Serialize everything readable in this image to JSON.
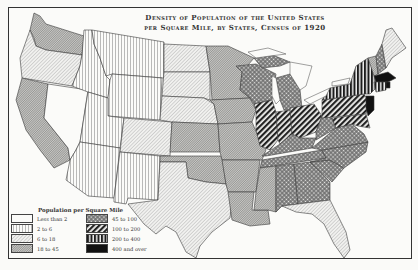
{
  "title": {
    "line1": "Density of Population of the United States",
    "line2": "per Square Mile, by States, Census of 1920"
  },
  "legend": {
    "title": "Population per Square Mile",
    "items": [
      {
        "label": "Less than 2",
        "pattern": "blank"
      },
      {
        "label": "2 to 6",
        "pattern": "vertical-lines"
      },
      {
        "label": "6 to 18",
        "pattern": "light-diagonal"
      },
      {
        "label": "18 to 45",
        "pattern": "dense-diagonal"
      },
      {
        "label": "45 to 100",
        "pattern": "crosshatch-dots"
      },
      {
        "label": "100 to 200",
        "pattern": "heavy-diagonal"
      },
      {
        "label": "200 to 400",
        "pattern": "heavy-vertical"
      },
      {
        "label": "400 and over",
        "pattern": "solid-black"
      }
    ]
  },
  "states": {
    "less_than_2": [
      "Nevada"
    ],
    "2_to_6": [
      "Montana",
      "Idaho",
      "Wyoming",
      "Utah",
      "Arizona",
      "New Mexico"
    ],
    "6_to_18": [
      "Oregon",
      "North Dakota",
      "South Dakota",
      "Nebraska",
      "Colorado",
      "Texas",
      "Florida",
      "Maine"
    ],
    "18_to_45": [
      "Washington",
      "California",
      "Minnesota",
      "Iowa",
      "Kansas",
      "Oklahoma",
      "Missouri",
      "Arkansas",
      "Louisiana",
      "Mississippi",
      "Vermont",
      "New Hampshire"
    ],
    "45_to_100": [
      "Wisconsin",
      "Michigan",
      "Kentucky",
      "Tennessee",
      "Alabama",
      "Georgia",
      "South Carolina",
      "North Carolina",
      "Virginia",
      "West Virginia"
    ],
    "100_to_200": [
      "Illinois",
      "Indiana",
      "Ohio",
      "Pennsylvania",
      "Delaware",
      "Maryland"
    ],
    "200_to_400": [
      "New York",
      "Connecticut"
    ],
    "400_and_over": [
      "New Jersey",
      "Massachusetts",
      "Rhode Island"
    ]
  },
  "colors": {
    "ink": "#333333",
    "paper": "#fbfbf9"
  }
}
